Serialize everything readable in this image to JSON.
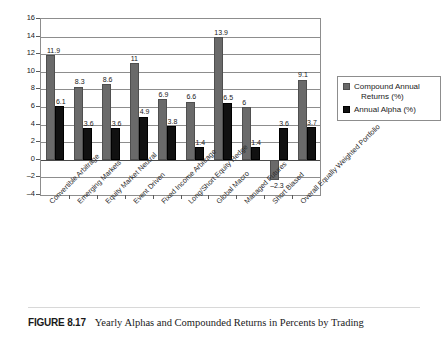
{
  "chart_data": {
    "type": "bar",
    "title": "",
    "xlabel": "",
    "ylabel": "",
    "ylim": [
      -4,
      16
    ],
    "ytick_step": 2,
    "yticks": [
      16,
      14,
      12,
      10,
      8,
      6,
      4,
      2,
      0,
      -2,
      -4
    ],
    "ytick_labels": [
      "16",
      "14",
      "12",
      "10",
      "8",
      "6",
      "4",
      "2",
      "0",
      "-2",
      "-4"
    ],
    "grid": true,
    "legend_position": "right",
    "categories": [
      "Convertible Arbitrage",
      "Emerging Markets",
      "Equity Market Neutral",
      "Event Driven",
      "Fixed Income Arbitrage",
      "Long/Short Equity Hedge",
      "Global Macro",
      "Managed Futures",
      "Short Biased",
      "Overall Equally Weighted Portfolio"
    ],
    "series": [
      {
        "name": "Compound Annual Returns (%)",
        "color": "#6a6a6a",
        "values": [
          11.9,
          8.3,
          8.6,
          11,
          6.9,
          6.6,
          13.9,
          6,
          -2.3,
          9.1
        ],
        "labels": [
          "11.9",
          "8.3",
          "8.6",
          "11",
          "6.9",
          "6.6",
          "13.9",
          "6",
          "–2.3",
          "9.1"
        ]
      },
      {
        "name": "Annual Alpha (%)",
        "color": "#111111",
        "values": [
          6.1,
          3.6,
          3.6,
          4.9,
          3.8,
          1.4,
          6.5,
          1.4,
          3.6,
          3.7
        ],
        "labels": [
          "6.1",
          "3.6",
          "3.6",
          "4.9",
          "3.8",
          "1.4",
          "6.5",
          "1.4",
          "3.6",
          "3.7"
        ]
      }
    ]
  },
  "legend": {
    "entries": [
      {
        "line1": "Compound Annual",
        "line2": "Returns (%)"
      },
      {
        "line1": "Annual Alpha (%)",
        "line2": ""
      }
    ]
  },
  "caption": {
    "figure_number": "FIGURE 8.17",
    "text": "Yearly Alphas and Compounded Returns in Percents by Trading"
  }
}
